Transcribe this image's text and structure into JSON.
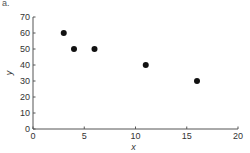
{
  "panel_label": "a.",
  "chart_data": {
    "type": "scatter",
    "title": "",
    "xlabel": "x",
    "ylabel": "y",
    "xlim": [
      0,
      20
    ],
    "ylim": [
      0,
      70
    ],
    "xticks": [
      0,
      5,
      10,
      15,
      20
    ],
    "yticks": [
      0,
      10,
      20,
      30,
      40,
      50,
      60,
      70
    ],
    "grid": false,
    "legend": null,
    "points": [
      {
        "x": 3,
        "y": 60
      },
      {
        "x": 4,
        "y": 50
      },
      {
        "x": 6,
        "y": 50
      },
      {
        "x": 11,
        "y": 40
      },
      {
        "x": 16,
        "y": 30
      }
    ],
    "marker_color": "#111111"
  }
}
